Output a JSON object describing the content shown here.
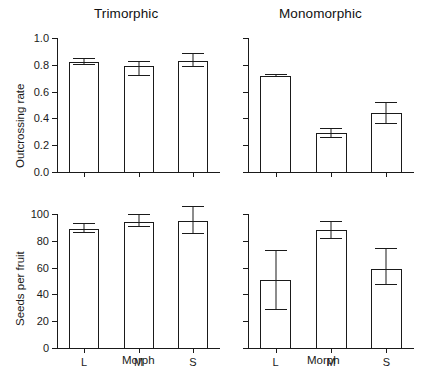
{
  "figure": {
    "panels": [
      {
        "id": "trimorphic",
        "title": "Trimorphic"
      },
      {
        "id": "monomorphic",
        "title": "Monomorphic"
      }
    ],
    "axis_titles": {
      "y_top": "Outcrossing rate",
      "y_bottom": "Seeds per fruit",
      "x_left": "Morph",
      "x_right": "Morph"
    }
  },
  "chart_data": [
    {
      "type": "bar",
      "id": "outcrossing-trimorphic",
      "title": "Trimorphic",
      "xlabel": "Morph",
      "ylabel": "Outcrossing rate",
      "categories": [
        "L",
        "M",
        "S"
      ],
      "values": [
        0.82,
        0.79,
        0.83
      ],
      "error_upper": [
        0.85,
        0.83,
        0.89
      ],
      "error_lower": [
        0.8,
        0.72,
        0.78
      ],
      "ylim": [
        0.0,
        1.0
      ],
      "yticks": [
        "0.0",
        "0.2",
        "0.4",
        "0.6",
        "0.8",
        "1.0"
      ],
      "ytick_values": [
        0.0,
        0.2,
        0.4,
        0.6,
        0.8,
        1.0
      ],
      "grid": false,
      "legend": "none"
    },
    {
      "type": "bar",
      "id": "outcrossing-monomorphic",
      "title": "Monomorphic",
      "xlabel": "Morph",
      "ylabel": "Outcrossing rate",
      "categories": [
        "L",
        "M",
        "S"
      ],
      "values": [
        0.72,
        0.29,
        0.44
      ],
      "error_upper": [
        0.73,
        0.33,
        0.52
      ],
      "error_lower": [
        0.71,
        0.25,
        0.36
      ],
      "ylim": [
        0.0,
        1.0
      ],
      "yticks": [],
      "ytick_values": [
        0.0,
        0.2,
        0.4,
        0.6,
        0.8,
        1.0
      ],
      "grid": false,
      "legend": "none"
    },
    {
      "type": "bar",
      "id": "seeds-trimorphic",
      "title": "Trimorphic",
      "xlabel": "Morph",
      "ylabel": "Seeds per fruit",
      "categories": [
        "L",
        "M",
        "S"
      ],
      "values": [
        89,
        94,
        95
      ],
      "error_upper": [
        93,
        100,
        106
      ],
      "error_lower": [
        86,
        90,
        85
      ],
      "ylim": [
        0,
        100
      ],
      "yticks": [
        "0",
        "20",
        "40",
        "60",
        "80",
        "100"
      ],
      "ytick_values": [
        0,
        20,
        40,
        60,
        80,
        100
      ],
      "grid": false,
      "legend": "none"
    },
    {
      "type": "bar",
      "id": "seeds-monomorphic",
      "title": "Monomorphic",
      "xlabel": "Morph",
      "ylabel": "Seeds per fruit",
      "categories": [
        "L",
        "M",
        "S"
      ],
      "values": [
        51,
        88,
        59
      ],
      "error_upper": [
        73,
        95,
        75
      ],
      "error_lower": [
        28,
        81,
        47
      ],
      "ylim": [
        0,
        100
      ],
      "yticks": [],
      "ytick_values": [
        0,
        20,
        40,
        60,
        80,
        100
      ],
      "grid": false,
      "legend": "none"
    }
  ],
  "style": {
    "line_color": "#1a1a1a",
    "bar_fill": "#ffffff",
    "background": "#ffffff"
  }
}
